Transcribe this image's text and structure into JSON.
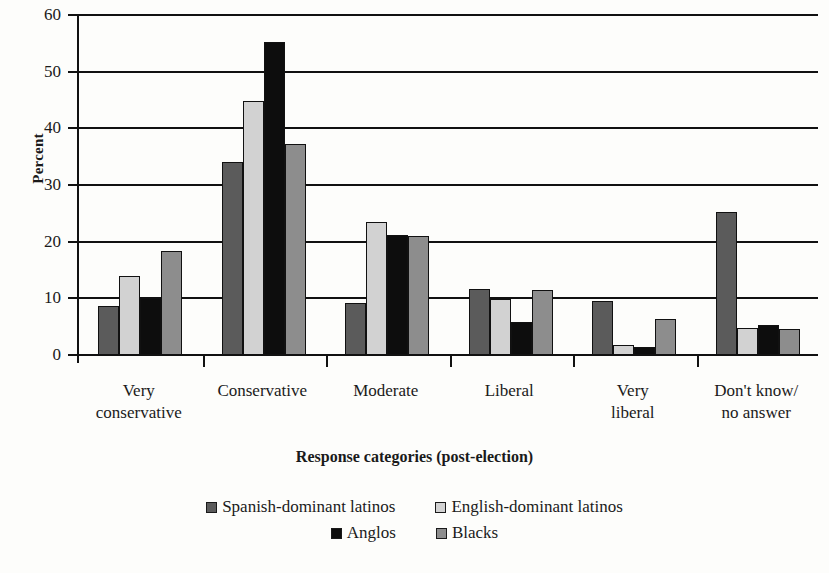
{
  "chart_data": {
    "type": "bar",
    "title": "",
    "xlabel": "Response categories (post-election)",
    "ylabel": "Percent",
    "ylim": [
      0,
      60
    ],
    "yticks": [
      0,
      10,
      20,
      30,
      40,
      50,
      60
    ],
    "grid": true,
    "legend_position": "bottom",
    "categories": [
      "Very conservative",
      "Conservative",
      "Moderate",
      "Liberal",
      "Very liberal",
      "Don't know/ no answer"
    ],
    "category_lines": [
      [
        "Very",
        "conservative"
      ],
      [
        "Conservative"
      ],
      [
        "Moderate"
      ],
      [
        "Liberal"
      ],
      [
        "Very",
        "liberal"
      ],
      [
        "Don't know/",
        "no answer"
      ]
    ],
    "series": [
      {
        "name": "Spanish-dominant latinos",
        "color": "#5b5b5b",
        "values": [
          8.6,
          34.0,
          9.2,
          11.6,
          9.6,
          25.2
        ]
      },
      {
        "name": "English-dominant latinos",
        "color": "#d2d2d2",
        "values": [
          14.0,
          44.8,
          23.5,
          9.8,
          1.7,
          4.8
        ]
      },
      {
        "name": "Anglos",
        "color": "#0d0d0d",
        "values": [
          10.0,
          55.3,
          21.2,
          5.8,
          1.4,
          5.3
        ]
      },
      {
        "name": "Blacks",
        "color": "#8d8d8d",
        "values": [
          18.3,
          37.3,
          21.0,
          11.4,
          6.3,
          4.6
        ]
      }
    ]
  },
  "legend": {
    "rows": [
      [
        "Spanish-dominant latinos",
        "English-dominant latinos"
      ],
      [
        "Anglos",
        "Blacks"
      ]
    ]
  }
}
